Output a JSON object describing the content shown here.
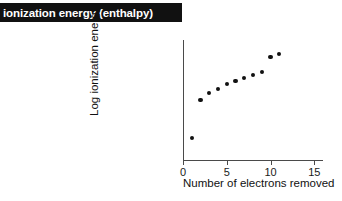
{
  "banner": {
    "title": "ionization energy (enthalpy)",
    "background_color": "#111111",
    "text_color": "#ffffff"
  },
  "chart_data": {
    "type": "scatter",
    "title": "",
    "xlabel": "Number of electrons removed",
    "ylabel": "Log ionization energy",
    "xlim": [
      0,
      16
    ],
    "ylim": [
      0,
      10
    ],
    "grid": false,
    "legend": null,
    "x_ticks": [
      0,
      5,
      10,
      15
    ],
    "x_tick_labels": [
      "0",
      "5",
      "10",
      "15"
    ],
    "y_ticks": [],
    "y_tick_labels": [],
    "marker": {
      "shape": "circle",
      "color": "#111111",
      "size_px": 4.2
    },
    "x": [
      1,
      2,
      3,
      4,
      5,
      6,
      7,
      8,
      9,
      10,
      11
    ],
    "y": [
      1.8,
      5.0,
      5.6,
      5.9,
      6.3,
      6.6,
      6.8,
      7.1,
      7.3,
      8.6,
      8.8
    ],
    "point_count": 11,
    "annotations": []
  }
}
